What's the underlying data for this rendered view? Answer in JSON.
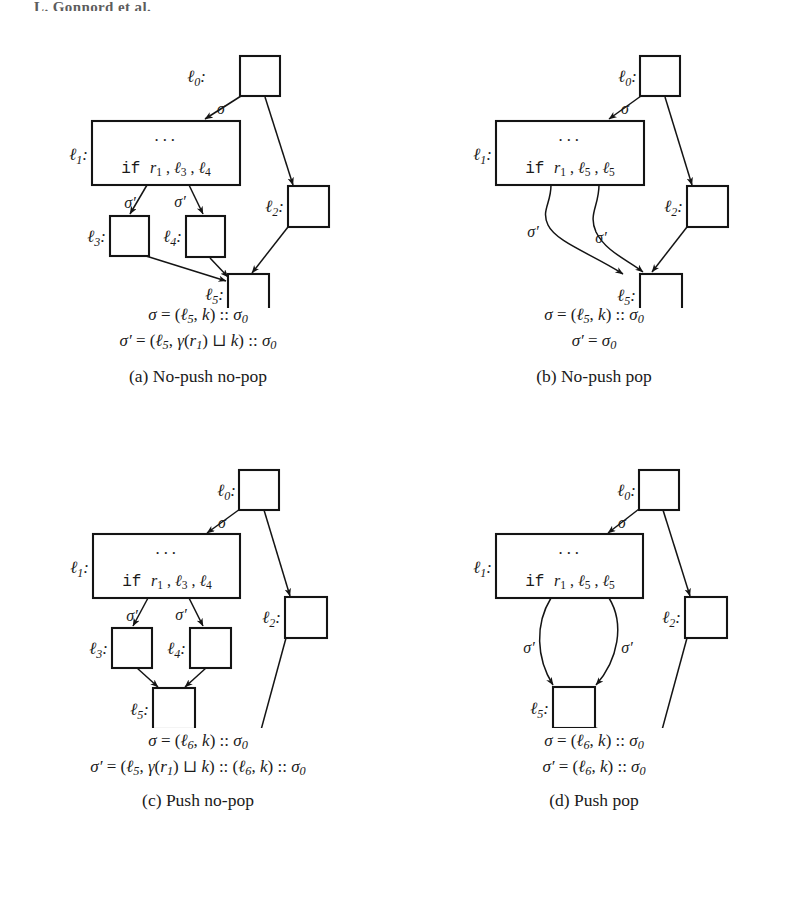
{
  "running_head": "L. Gonnord et al.",
  "figure": {
    "panels": [
      {
        "id": "a",
        "caption": "(a) No-push no-pop",
        "if_line": {
          "keyword": "if",
          "register": "r",
          "register_sub": "1",
          "target_1": "3",
          "target_2": "4"
        },
        "dots": "···",
        "nodes": [
          {
            "name": "l0",
            "label": "ℓ",
            "sub": "0"
          },
          {
            "name": "l1",
            "label": "ℓ",
            "sub": "1"
          },
          {
            "name": "l2",
            "label": "ℓ",
            "sub": "2"
          },
          {
            "name": "l3",
            "label": "ℓ",
            "sub": "3"
          },
          {
            "name": "l4",
            "label": "ℓ",
            "sub": "4"
          },
          {
            "name": "l5",
            "label": "ℓ",
            "sub": "5"
          }
        ],
        "edge_labels": [
          {
            "name": "sigma",
            "text": "σ"
          },
          {
            "name": "sigma-prime-left",
            "text": "σ′"
          },
          {
            "name": "sigma-prime-right",
            "text": "σ′"
          }
        ],
        "formulas": [
          "σ = (ℓ5, k) :: σ0",
          "σ′ = (ℓ5, γ(r1) ⊔ k) :: σ0"
        ]
      },
      {
        "id": "b",
        "caption": "(b) No-push pop",
        "if_line": {
          "keyword": "if",
          "register": "r",
          "register_sub": "1",
          "target_1": "5",
          "target_2": "5"
        },
        "dots": "···",
        "nodes": [
          {
            "name": "l0",
            "label": "ℓ",
            "sub": "0"
          },
          {
            "name": "l1",
            "label": "ℓ",
            "sub": "1"
          },
          {
            "name": "l2",
            "label": "ℓ",
            "sub": "2"
          },
          {
            "name": "l5",
            "label": "ℓ",
            "sub": "5"
          }
        ],
        "edge_labels": [
          {
            "name": "sigma",
            "text": "σ"
          },
          {
            "name": "sigma-prime-left",
            "text": "σ′"
          },
          {
            "name": "sigma-prime-right",
            "text": "σ′"
          }
        ],
        "formulas": [
          "σ = (ℓ5, k) :: σ0",
          "σ′ = σ0"
        ]
      },
      {
        "id": "c",
        "caption": "(c) Push no-pop",
        "if_line": {
          "keyword": "if",
          "register": "r",
          "register_sub": "1",
          "target_1": "3",
          "target_2": "4"
        },
        "dots": "···",
        "nodes": [
          {
            "name": "l0",
            "label": "ℓ",
            "sub": "0"
          },
          {
            "name": "l1",
            "label": "ℓ",
            "sub": "1"
          },
          {
            "name": "l2",
            "label": "ℓ",
            "sub": "2"
          },
          {
            "name": "l3",
            "label": "ℓ",
            "sub": "3"
          },
          {
            "name": "l4",
            "label": "ℓ",
            "sub": "4"
          },
          {
            "name": "l5",
            "label": "ℓ",
            "sub": "5"
          },
          {
            "name": "l6",
            "label": "ℓ",
            "sub": "6"
          }
        ],
        "edge_labels": [
          {
            "name": "sigma",
            "text": "σ"
          },
          {
            "name": "sigma-prime-left",
            "text": "σ′"
          },
          {
            "name": "sigma-prime-right",
            "text": "σ′"
          }
        ],
        "formulas": [
          "σ = (ℓ6, k) :: σ0",
          "σ′ = (ℓ5, γ(r1) ⊔ k) :: (ℓ6, k) :: σ0"
        ]
      },
      {
        "id": "d",
        "caption": "(d) Push pop",
        "if_line": {
          "keyword": "if",
          "register": "r",
          "register_sub": "1",
          "target_1": "5",
          "target_2": "5"
        },
        "dots": "···",
        "nodes": [
          {
            "name": "l0",
            "label": "ℓ",
            "sub": "0"
          },
          {
            "name": "l1",
            "label": "ℓ",
            "sub": "1"
          },
          {
            "name": "l2",
            "label": "ℓ",
            "sub": "2"
          },
          {
            "name": "l5",
            "label": "ℓ",
            "sub": "5"
          },
          {
            "name": "l6",
            "label": "ℓ",
            "sub": "6"
          }
        ],
        "edge_labels": [
          {
            "name": "sigma",
            "text": "σ"
          },
          {
            "name": "sigma-prime-left",
            "text": "σ′"
          },
          {
            "name": "sigma-prime-right",
            "text": "σ′"
          }
        ],
        "formulas": [
          "σ = (ℓ6, k) :: σ0",
          "σ′ = (ℓ6, k) :: σ0"
        ]
      }
    ]
  }
}
